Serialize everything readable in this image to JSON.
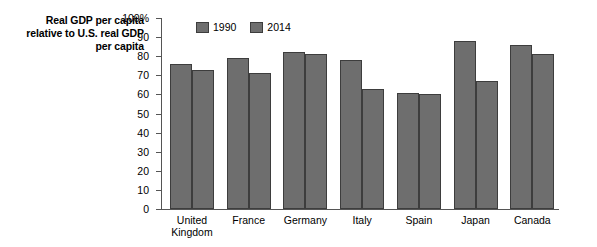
{
  "chart_data": {
    "type": "bar",
    "title": "",
    "ylabel": "Real GDP per capita relative to U.S. real GDP per capita",
    "ylabel_lines": [
      "Real GDP per capita",
      "relative to U.S. real GDP",
      "per capita"
    ],
    "xlabel": "",
    "ylim": [
      0,
      100
    ],
    "y_ticks": [
      0,
      10,
      20,
      30,
      40,
      50,
      60,
      70,
      80,
      90,
      100
    ],
    "y_tick_labels": [
      "0",
      "10",
      "20",
      "30",
      "40",
      "50",
      "60",
      "70",
      "80",
      "90",
      "100%"
    ],
    "grid": false,
    "legend_position": "top-left-inside",
    "categories": [
      "United Kingdom",
      "France",
      "Germany",
      "Italy",
      "Spain",
      "Japan",
      "Canada"
    ],
    "category_label_lines": [
      [
        "United",
        "Kingdom"
      ],
      [
        "France"
      ],
      [
        "Germany"
      ],
      [
        "Italy"
      ],
      [
        "Spain"
      ],
      [
        "Japan"
      ],
      [
        "Canada"
      ]
    ],
    "series": [
      {
        "name": "1990",
        "color": "#6e6e6e",
        "values": [
          76,
          79,
          82,
          78,
          61,
          88,
          86
        ]
      },
      {
        "name": "2014",
        "color": "#6e6e6e",
        "values": [
          73,
          71,
          81,
          63,
          60,
          67,
          81
        ]
      }
    ]
  },
  "colors": {
    "bar_fill": "#6e6e6e",
    "bar_edge": "#3d3d3d",
    "axis": "#555555",
    "background": "#ffffff",
    "text": "#000000"
  }
}
